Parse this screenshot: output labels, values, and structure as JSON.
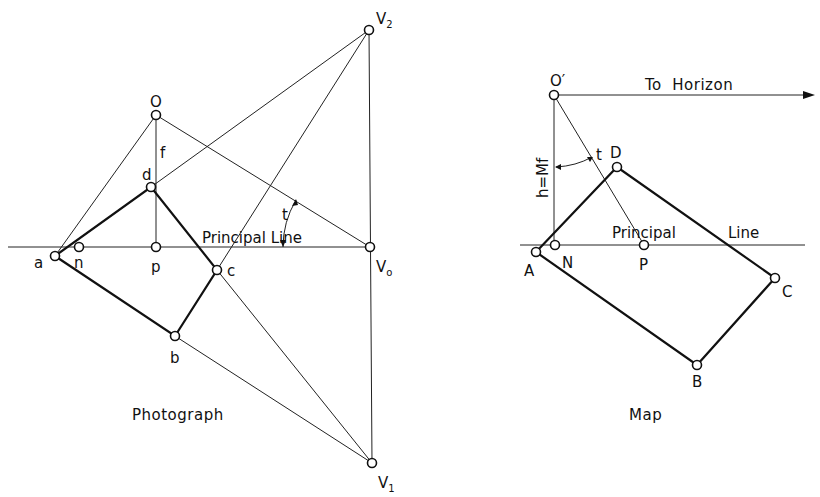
{
  "photograph": {
    "caption": "Photograph",
    "principal_line_label": "Principal Line",
    "angle_label": "t",
    "focal_label": "f",
    "points": {
      "O": {
        "label": "O",
        "x": 156,
        "y": 115
      },
      "d": {
        "label": "d",
        "x": 151,
        "y": 187
      },
      "a": {
        "label": "a",
        "x": 55,
        "y": 256
      },
      "n": {
        "label": "n",
        "x": 79,
        "y": 247
      },
      "p": {
        "label": "p",
        "x": 156,
        "y": 247
      },
      "c": {
        "label": "c",
        "x": 217,
        "y": 270
      },
      "b": {
        "label": "b",
        "x": 175,
        "y": 336
      },
      "V2": {
        "label": "V",
        "sub": "2",
        "x": 369,
        "y": 30
      },
      "Vo": {
        "label": "V",
        "sub": "o",
        "x": 370,
        "y": 247
      },
      "V1": {
        "label": "V",
        "sub": "1",
        "x": 372,
        "y": 463
      }
    }
  },
  "map": {
    "caption": "Map",
    "principal_line_label": "Principal",
    "principal_line_label2": "Line",
    "horizon_label": "To  Horizon",
    "height_label": "h=Mf",
    "angle_label": "t",
    "points": {
      "O'": {
        "label": "O′",
        "x": 554,
        "y": 95
      },
      "D": {
        "label": "D",
        "x": 617,
        "y": 167
      },
      "A": {
        "label": "A",
        "x": 536,
        "y": 252
      },
      "N": {
        "label": "N",
        "x": 555,
        "y": 245
      },
      "P": {
        "label": "P",
        "x": 644,
        "y": 245
      },
      "C": {
        "label": "C",
        "x": 775,
        "y": 278
      },
      "B": {
        "label": "B",
        "x": 697,
        "y": 365
      }
    }
  }
}
